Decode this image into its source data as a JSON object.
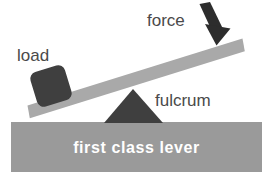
{
  "diagram": {
    "title": "first class lever",
    "labels": {
      "load": "load",
      "force": "force",
      "fulcrum": "fulcrum",
      "ground": "first class lever"
    },
    "icons": {
      "force_arrow": "down-arrow-icon",
      "fulcrum_shape": "triangle-icon",
      "load_shape": "block-icon",
      "lever_shape": "beam-icon",
      "ground_shape": "ground-icon"
    },
    "colors": {
      "background": "#ffffff",
      "ground_block": "#9a9a9a",
      "lever_beam": "#a9a9a9",
      "fulcrum": "#3f3f3f",
      "load_block": "#3f3f3f",
      "arrow": "#2d2d2d",
      "label_text": "#4a4a4a",
      "ground_text": "#ffffff"
    },
    "geometry": {
      "ground_block": {
        "x": 11,
        "y": 122,
        "width": 251,
        "height": 50
      },
      "lever_beam": {
        "left_end_x": 28,
        "left_end_y": 113,
        "right_end_x": 243,
        "right_end_y": 46,
        "thickness": 13
      },
      "fulcrum_triangle": {
        "apex_x": 133,
        "apex_y": 89,
        "base_left_x": 104,
        "base_right_x": 163,
        "base_y": 123
      },
      "load_block": {
        "center_x": 51,
        "center_y": 86,
        "size": 36,
        "rotation_deg": -17
      },
      "force_arrow": {
        "tail_x": 201,
        "tail_y": 5,
        "head_x": 228,
        "head_y": 45
      }
    }
  }
}
